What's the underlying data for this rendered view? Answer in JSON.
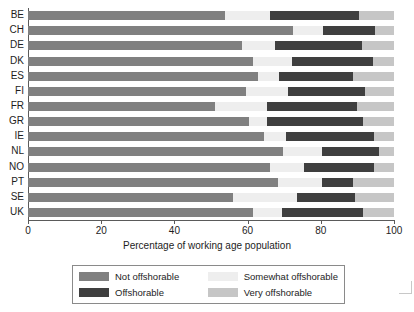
{
  "chart_data": {
    "type": "bar",
    "orientation": "horizontal",
    "stacked": true,
    "title": "",
    "xlabel": "Percentage of working age population",
    "ylabel": "",
    "xlim": [
      0,
      100
    ],
    "xticks": [
      0,
      20,
      40,
      60,
      80,
      100
    ],
    "grid": false,
    "legend_position": "bottom",
    "categories": [
      "BE",
      "CH",
      "DE",
      "DK",
      "ES",
      "FI",
      "FR",
      "GR",
      "IE",
      "NL",
      "NO",
      "PT",
      "SE",
      "UK"
    ],
    "series": [
      {
        "name": "Not offshorable",
        "color": "#808080",
        "values": [
          53.8,
          72.4,
          58.6,
          61.4,
          62.9,
          59.6,
          51.1,
          60.5,
          64.6,
          69.8,
          66.0,
          68.4,
          55.9,
          67.5
        ]
      },
      {
        "name": "Somewhat offshorable",
        "color": "#eeeeee",
        "values": [
          12.3,
          8.3,
          8.9,
          10.8,
          5.7,
          11.5,
          14.2,
          4.7,
          6.0,
          10.4,
          9.5,
          11.8,
          17.5,
          8.9
        ]
      },
      {
        "name": "Offshorable",
        "color": "#3f3f3f",
        "values": [
          24.4,
          14.1,
          23.7,
          22.0,
          20.3,
          21.0,
          24.6,
          26.4,
          23.9,
          15.7,
          19.0,
          8.5,
          15.9,
          24.3
        ]
      },
      {
        "name": "Very offshorable",
        "color": "#c6c6c6",
        "values": [
          9.5,
          5.2,
          8.8,
          5.8,
          11.1,
          7.9,
          10.1,
          8.4,
          5.5,
          4.1,
          5.5,
          11.3,
          10.7,
          9.3
        ]
      }
    ]
  },
  "axis": {
    "x_title": "Percentage of working age population",
    "x_tick_labels": [
      "0",
      "20",
      "40",
      "60",
      "80",
      "100"
    ],
    "y_tick_labels": [
      "BE",
      "CH",
      "DE",
      "DK",
      "ES",
      "FI",
      "FR",
      "GR",
      "IE",
      "NL",
      "NO",
      "PT",
      "SE",
      "UK"
    ]
  },
  "legend": {
    "items": [
      {
        "label": "Not offshorable",
        "color": "#808080"
      },
      {
        "label": "Somewhat offshorable",
        "color": "#eeeeee"
      },
      {
        "label": "Offshorable",
        "color": "#3f3f3f"
      },
      {
        "label": "Very offshorable",
        "color": "#c6c6c6"
      }
    ]
  }
}
